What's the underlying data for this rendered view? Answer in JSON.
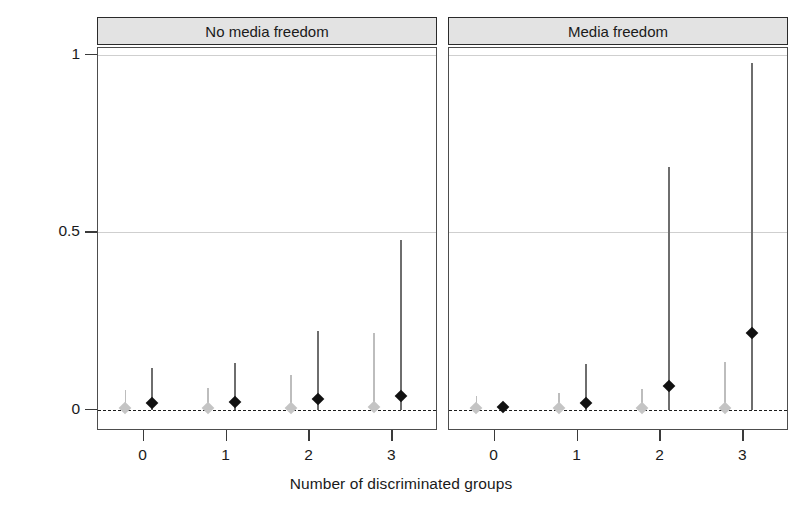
{
  "chart_data": {
    "type": "scatter",
    "title": "",
    "xlabel": "Number of discriminated groups",
    "ylabel": "Probability of ethnic conflict onset",
    "xlim": [
      -0.55,
      3.55
    ],
    "ylim": [
      -0.06,
      1.02
    ],
    "ytick_labels": [
      "0",
      "0.5",
      "1"
    ],
    "ytick_values": [
      0,
      0.5,
      1
    ],
    "xtick_labels": [
      "0",
      "1",
      "2",
      "3"
    ],
    "xtick_values": [
      0,
      1,
      2,
      3
    ],
    "gridlines": [
      0.5,
      1.0
    ],
    "reference_line": 0,
    "grid": true,
    "legend": "none",
    "panel_labels": [
      "No media freedom",
      "Media freedom"
    ],
    "series": [
      {
        "name": "lower-estimate",
        "color": "#c4c4c4",
        "offset": -0.22,
        "panels": [
          {
            "panel": "No media freedom",
            "points": [
              {
                "x": 0,
                "estimate": 0.005,
                "ci_low": 0.0,
                "ci_high": 0.055
              },
              {
                "x": 1,
                "estimate": 0.005,
                "ci_low": 0.0,
                "ci_high": 0.062
              },
              {
                "x": 2,
                "estimate": 0.006,
                "ci_low": 0.0,
                "ci_high": 0.098
              },
              {
                "x": 3,
                "estimate": 0.007,
                "ci_low": 0.0,
                "ci_high": 0.215
              }
            ]
          },
          {
            "panel": "Media freedom",
            "points": [
              {
                "x": 0,
                "estimate": 0.004,
                "ci_low": 0.0,
                "ci_high": 0.04
              },
              {
                "x": 1,
                "estimate": 0.004,
                "ci_low": 0.0,
                "ci_high": 0.046
              },
              {
                "x": 2,
                "estimate": 0.005,
                "ci_low": 0.0,
                "ci_high": 0.058
              },
              {
                "x": 3,
                "estimate": 0.006,
                "ci_low": 0.0,
                "ci_high": 0.135
              }
            ]
          }
        ]
      },
      {
        "name": "point-estimate",
        "color": "#111111",
        "offset": 0.1,
        "panels": [
          {
            "panel": "No media freedom",
            "points": [
              {
                "x": 0,
                "estimate": 0.02,
                "ci_low": 0.0,
                "ci_high": 0.118
              },
              {
                "x": 1,
                "estimate": 0.022,
                "ci_low": 0.0,
                "ci_high": 0.132
              },
              {
                "x": 2,
                "estimate": 0.031,
                "ci_low": 0.0,
                "ci_high": 0.222
              },
              {
                "x": 3,
                "estimate": 0.039,
                "ci_low": 0.0,
                "ci_high": 0.478
              }
            ]
          },
          {
            "panel": "Media freedom",
            "points": [
              {
                "x": 0,
                "estimate": 0.008,
                "ci_low": 0.0,
                "ci_high": 0.02
              },
              {
                "x": 1,
                "estimate": 0.02,
                "ci_low": 0.0,
                "ci_high": 0.128
              },
              {
                "x": 2,
                "estimate": 0.066,
                "ci_low": 0.0,
                "ci_high": 0.685
              },
              {
                "x": 3,
                "estimate": 0.216,
                "ci_low": 0.0,
                "ci_high": 0.978
              }
            ]
          }
        ]
      }
    ]
  }
}
